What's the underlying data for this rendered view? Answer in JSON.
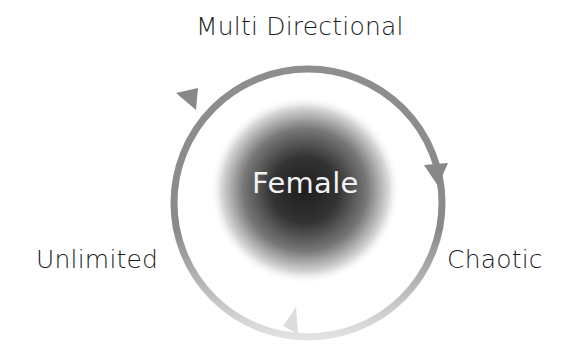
{
  "diagram": {
    "type": "cycle",
    "center": {
      "label": "Female"
    },
    "labels": {
      "top": "Multi Directional",
      "right": "Chaotic",
      "left": "Unlimited"
    },
    "direction": "clockwise",
    "colors": {
      "ring": "#8a8a8a",
      "ring_light": "#d6d6d6",
      "center_dark": "#1e1e1e",
      "text": "#1c1c1c",
      "center_text": "#f2f2f2",
      "background": "#ffffff"
    }
  }
}
